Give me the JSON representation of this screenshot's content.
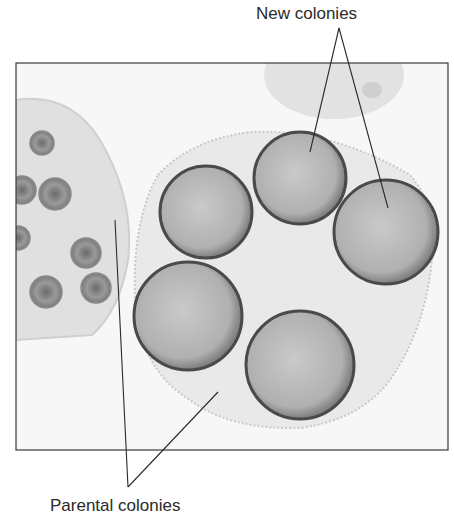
{
  "figure": {
    "labels": {
      "new_colonies": "New colonies",
      "parental_colonies": "Parental colonies"
    },
    "colors": {
      "frame": "#3a3a3a",
      "leader_line": "#2a2a2a",
      "colony_rim": "#4a4a4a",
      "colony_fill": "#a8a8a8",
      "parent_fill": "#e6e6e6",
      "background": "#f4f4f4"
    },
    "daughter_colonies": [
      {
        "cx": 206,
        "cy": 212,
        "r": 46
      },
      {
        "cx": 300,
        "cy": 178,
        "r": 46
      },
      {
        "cx": 386,
        "cy": 232,
        "r": 52
      },
      {
        "cx": 188,
        "cy": 316,
        "r": 54
      },
      {
        "cx": 300,
        "cy": 365,
        "r": 54
      }
    ],
    "left_parent_inner_colonies": [
      {
        "cx": 22,
        "cy": 190,
        "r": 14
      },
      {
        "cx": 55,
        "cy": 194,
        "r": 16
      },
      {
        "cx": 18,
        "cy": 238,
        "r": 12
      },
      {
        "cx": 86,
        "cy": 253,
        "r": 15
      },
      {
        "cx": 46,
        "cy": 292,
        "r": 16
      },
      {
        "cx": 96,
        "cy": 288,
        "r": 15
      },
      {
        "cx": 42,
        "cy": 143,
        "r": 12
      }
    ]
  }
}
